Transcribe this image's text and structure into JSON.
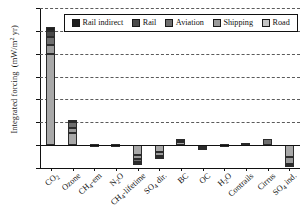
{
  "chart_data": {
    "type": "bar",
    "stacked": true,
    "title": "",
    "xlabel": "",
    "ylabel": "Integrated forcing  (mW/m2 yr)",
    "ylabel_display": "Integrated forcing  (mW/m² yr)",
    "ylim": [
      -100,
      600
    ],
    "yticks": [
      600,
      500,
      400,
      300,
      200,
      100,
      0,
      -100
    ],
    "ytick_labels": [
      "600",
      "500",
      "400",
      "300",
      "200",
      "100",
      "0",
      "-100"
    ],
    "grid": "horizontal-dashed",
    "legend_position": "top-center-inside",
    "categories": [
      "CO2",
      "Ozone",
      "CH4-em",
      "N2O",
      "CH4-lifetime",
      "SO4 dir.",
      "BC",
      "OC",
      "H2O",
      "Contrails",
      "Cirrus",
      "SO4 ind."
    ],
    "category_labels_html": [
      "CO<sub>2</sub>",
      "Ozone",
      "CH<sub>4</sub>-em",
      "N<sub>2</sub>O",
      "CH<sub>4</sub>-lifetime",
      "SO<sub>4</sub> dir.",
      "BC",
      "OC",
      "H<sub>2</sub>O",
      "Contrails",
      "Cirrus",
      "SO<sub>4</sub> ind."
    ],
    "series": [
      {
        "name": "Road",
        "color": "#a8a8a8",
        "values": [
          400,
          55,
          2.5,
          2.5,
          -42,
          -30,
          14,
          -7,
          1.5,
          0,
          0,
          -52
        ]
      },
      {
        "name": "Shipping",
        "color": "#9a9a9a",
        "values": [
          40,
          20,
          0.8,
          0.6,
          -20,
          -16,
          2,
          -3,
          0.6,
          0,
          0,
          -30
        ]
      },
      {
        "name": "Aviation",
        "color": "#6e6e6e",
        "values": [
          35,
          30,
          0.5,
          0.4,
          -12,
          -5,
          5,
          -1.5,
          1.2,
          8,
          28,
          -6
        ]
      },
      {
        "name": "Rail",
        "color": "#4a4a4a",
        "values": [
          25,
          2,
          0.3,
          0.2,
          -3,
          -1,
          3,
          -0.6,
          0.3,
          0,
          0,
          -2
        ]
      },
      {
        "name": "Rail indirect",
        "color": "#1f1f1f",
        "values": [
          15,
          1,
          0.2,
          0.1,
          -1,
          0,
          1,
          -0.3,
          0.2,
          0,
          0,
          0
        ]
      }
    ],
    "stack_totals_positive": [
      515,
      108,
      4.3,
      3.8,
      0,
      0,
      25,
      0,
      3.8,
      8,
      28,
      0
    ],
    "stack_totals_negative": [
      0,
      0,
      0,
      0,
      -78,
      -52,
      0,
      -12.4,
      0,
      0,
      0,
      -90
    ]
  },
  "legend": {
    "items": [
      {
        "label": "Rail indirect",
        "color": "#1f1f1f"
      },
      {
        "label": "Rail",
        "color": "#4a4a4a"
      },
      {
        "label": "Aviation",
        "color": "#6e6e6e"
      },
      {
        "label": "Shipping",
        "color": "#9a9a9a"
      },
      {
        "label": "Road",
        "color": "#c4c4c4"
      }
    ]
  }
}
